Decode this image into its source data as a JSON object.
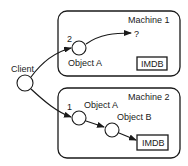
{
  "diagram": {
    "client": {
      "label": "Client"
    },
    "machines": [
      {
        "title": "Machine 1",
        "call_order": "2",
        "objects": [
          {
            "label": "Object A"
          }
        ],
        "unknown_target": "?",
        "database": "IMDB"
      },
      {
        "title": "Machine 2",
        "call_order": "1",
        "objects": [
          {
            "label": "Object A"
          },
          {
            "label": "Object B"
          }
        ],
        "database": "IMDB"
      }
    ],
    "colors": {
      "stroke": "#1a1a1a",
      "fill": "#ffffff"
    }
  }
}
